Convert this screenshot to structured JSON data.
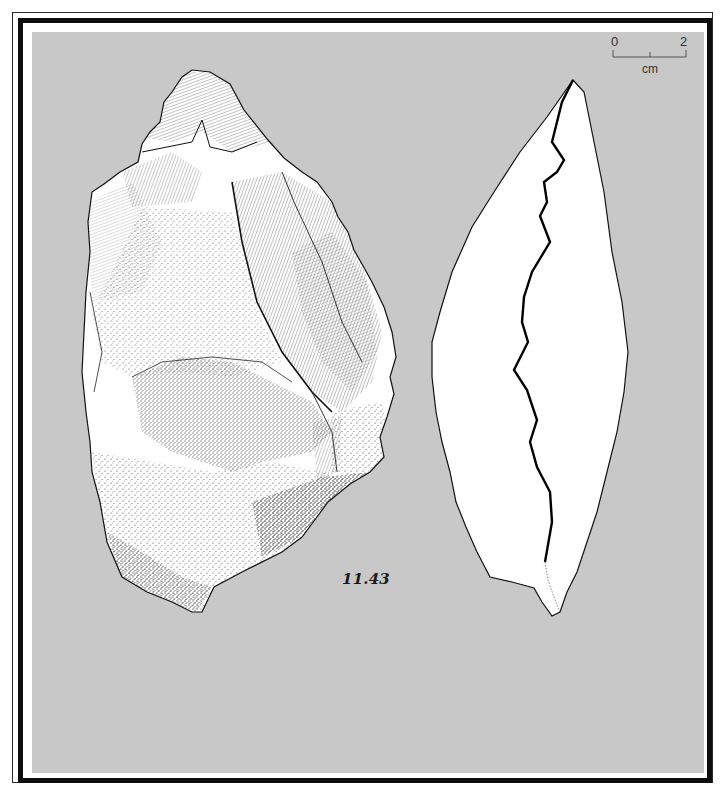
{
  "plate": {
    "background_color": "#c8c8c8",
    "frame_color": "#0d0d0d",
    "catalog_number": "11.43",
    "scale_bar": {
      "start_label": "0",
      "end_label": "2",
      "unit_label": "cm"
    },
    "views": [
      {
        "name": "dorsal-view",
        "description": "stippled and hatched stone tool drawing (dorsal face)"
      },
      {
        "name": "profile-view",
        "description": "outline section view with jagged ridge line"
      }
    ]
  }
}
